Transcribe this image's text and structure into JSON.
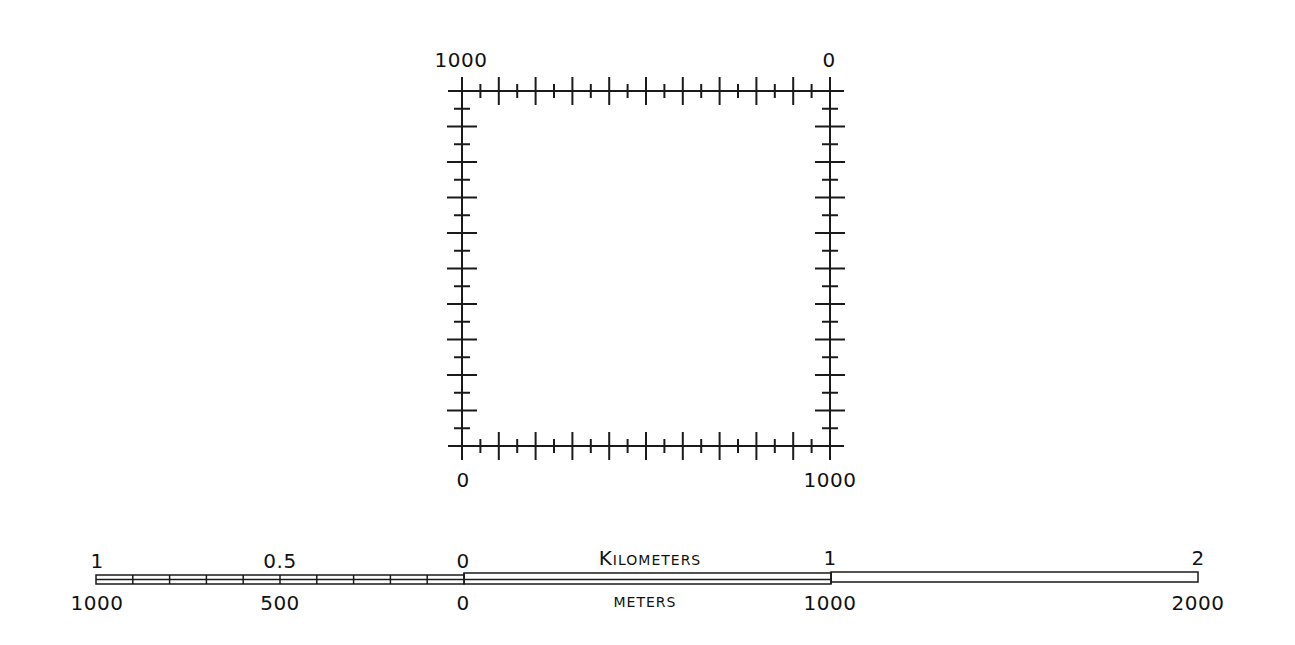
{
  "frame": {
    "corner_labels": {
      "top_left": "1000",
      "top_right": "0",
      "bottom_left": "0",
      "bottom_right": "1000"
    },
    "ticks_per_side": 20,
    "major_every": 2,
    "stroke_color": "#1a1a1a"
  },
  "scale_bar": {
    "kilometers": {
      "unit_label": "Kilometers",
      "labels": [
        "1",
        "0.5",
        "0",
        "1",
        "2"
      ]
    },
    "meters": {
      "unit_label": "meters",
      "labels": [
        "1000",
        "500",
        "0",
        "1000",
        "2000"
      ]
    },
    "left_subdivisions": 10,
    "stroke_color": "#1a1a1a"
  }
}
